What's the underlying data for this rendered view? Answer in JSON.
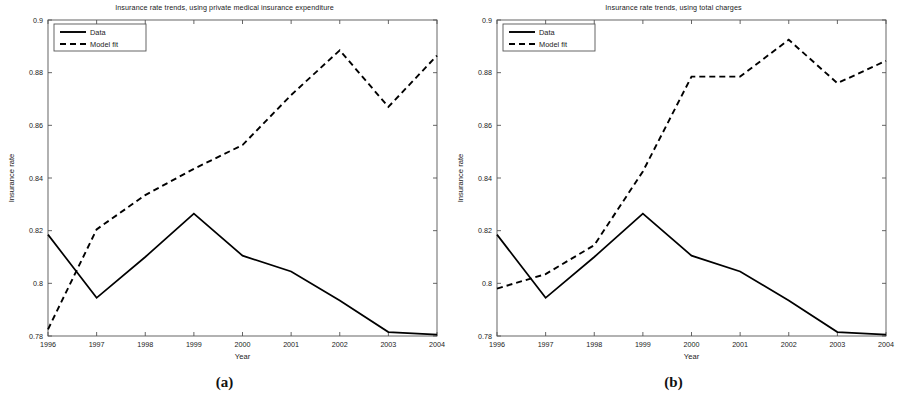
{
  "figure": {
    "subfigures": [
      {
        "label": "(a)",
        "chart_index": 0
      },
      {
        "label": "(b)",
        "chart_index": 1
      }
    ]
  },
  "chart_data": [
    {
      "type": "line",
      "title": "Insurance rate trends, using private medical insurance expenditure",
      "xlabel": "Year",
      "ylabel": "Insurance rate",
      "categories": [
        "1996",
        "1997",
        "1998",
        "1999",
        "2000",
        "2001",
        "2002",
        "2003",
        "2004"
      ],
      "x": [
        1996,
        1997,
        1998,
        1999,
        2000,
        2001,
        2002,
        2003,
        2004
      ],
      "xlim": [
        1996,
        2004
      ],
      "ylim": [
        0.78,
        0.9
      ],
      "yticks": [
        "0.78",
        "0.8",
        "0.82",
        "0.84",
        "0.86",
        "0.88",
        "0.9"
      ],
      "ytick_values": [
        0.78,
        0.8,
        0.82,
        0.84,
        0.86,
        0.88,
        0.9
      ],
      "xticks": [
        "1996",
        "1997",
        "1998",
        "1999",
        "2000",
        "2001",
        "2002",
        "2003",
        "2004"
      ],
      "grid": false,
      "legend_position": "top-left",
      "series": [
        {
          "name": "Data",
          "style": "solid",
          "color": "#000000",
          "values": [
            0.8185,
            0.7945,
            0.81,
            0.8265,
            0.8105,
            0.8045,
            0.7935,
            0.7815,
            0.7805
          ]
        },
        {
          "name": "Model fit",
          "style": "dashed",
          "color": "#000000",
          "values": [
            0.7825,
            0.8205,
            0.8335,
            0.8435,
            0.8525,
            0.8715,
            0.8885,
            0.867,
            0.8865
          ]
        }
      ]
    },
    {
      "type": "line",
      "title": "Insurance rate trends, using total charges",
      "xlabel": "Year",
      "ylabel": "Insurance rate",
      "categories": [
        "1996",
        "1997",
        "1998",
        "1999",
        "2000",
        "2001",
        "2002",
        "2003",
        "2004"
      ],
      "x": [
        1996,
        1997,
        1998,
        1999,
        2000,
        2001,
        2002,
        2003,
        2004
      ],
      "xlim": [
        1996,
        2004
      ],
      "ylim": [
        0.78,
        0.9
      ],
      "yticks": [
        "0.78",
        "0.8",
        "0.82",
        "0.84",
        "0.86",
        "0.88",
        "0.9"
      ],
      "ytick_values": [
        0.78,
        0.8,
        0.82,
        0.84,
        0.86,
        0.88,
        0.9
      ],
      "xticks": [
        "1996",
        "1997",
        "1998",
        "1999",
        "2000",
        "2001",
        "2002",
        "2003",
        "2004"
      ],
      "grid": false,
      "legend_position": "top-left",
      "series": [
        {
          "name": "Data",
          "style": "solid",
          "color": "#000000",
          "values": [
            0.8185,
            0.7945,
            0.81,
            0.8265,
            0.8105,
            0.8045,
            0.7935,
            0.7815,
            0.7805
          ]
        },
        {
          "name": "Model fit",
          "style": "dashed",
          "color": "#000000",
          "values": [
            0.798,
            0.8035,
            0.8145,
            0.8425,
            0.8785,
            0.8785,
            0.8925,
            0.876,
            0.8845
          ]
        }
      ]
    }
  ]
}
